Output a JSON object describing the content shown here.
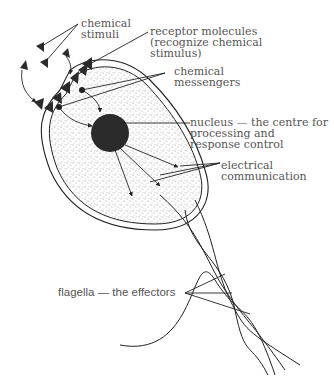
{
  "diagram": {
    "colors": {
      "line": "#222222",
      "text": "#555555",
      "nucleus": "#2b2b2b",
      "background": "#ffffff"
    },
    "labels": {
      "chemical_stimuli": [
        "chemical",
        "stimuli"
      ],
      "receptor_molecules": [
        "receptor molecules",
        "(recognize chemical",
        "stimulus)"
      ],
      "chemical_messengers": [
        "chemical",
        "messengers"
      ],
      "nucleus": [
        "nucleus — the centre for",
        "processing and",
        "response control"
      ],
      "electrical_communication": [
        "electrical",
        "communication"
      ],
      "flagella": "flagella — the effectors"
    }
  }
}
